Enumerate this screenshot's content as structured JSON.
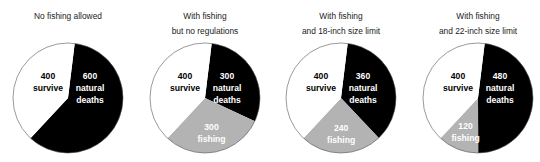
{
  "chart_data": [
    {
      "type": "pie",
      "title": "No fishing allowed",
      "title_lines": [
        "No fishing allowed"
      ],
      "slices": [
        {
          "name": "natural deaths",
          "value": 600,
          "color": "#000000",
          "label_lines": [
            "600",
            "natural",
            "deaths"
          ],
          "label_color": "#ffffff"
        },
        {
          "name": "fishing",
          "value": 0,
          "color": "#b3b3b3",
          "label_lines": [],
          "label_color": "#ffffff"
        },
        {
          "name": "survive",
          "value": 400,
          "color": "#ffffff",
          "label_lines": [
            "400",
            "survive"
          ],
          "label_color": "#000000"
        }
      ],
      "start_angle_deg": 7
    },
    {
      "type": "pie",
      "title": "With fishing but no regulations",
      "title_lines": [
        "With fishing",
        "but no regulations"
      ],
      "slices": [
        {
          "name": "natural deaths",
          "value": 300,
          "color": "#000000",
          "label_lines": [
            "300",
            "natural",
            "deaths"
          ],
          "label_color": "#ffffff"
        },
        {
          "name": "fishing",
          "value": 300,
          "color": "#b3b3b3",
          "label_lines": [
            "300",
            "fishing"
          ],
          "label_color": "#ffffff"
        },
        {
          "name": "survive",
          "value": 400,
          "color": "#ffffff",
          "label_lines": [
            "400",
            "survive"
          ],
          "label_color": "#000000"
        }
      ],
      "start_angle_deg": 7
    },
    {
      "type": "pie",
      "title": "With fishing and 18-inch size limit",
      "title_lines": [
        "With fishing",
        "and 18-inch size limit"
      ],
      "slices": [
        {
          "name": "natural deaths",
          "value": 360,
          "color": "#000000",
          "label_lines": [
            "360",
            "natural",
            "deaths"
          ],
          "label_color": "#ffffff"
        },
        {
          "name": "fishing",
          "value": 240,
          "color": "#b3b3b3",
          "label_lines": [
            "240",
            "fishing"
          ],
          "label_color": "#ffffff"
        },
        {
          "name": "survive",
          "value": 400,
          "color": "#ffffff",
          "label_lines": [
            "400",
            "survive"
          ],
          "label_color": "#000000"
        }
      ],
      "start_angle_deg": 7
    },
    {
      "type": "pie",
      "title": "With fishing and 22-inch size limit",
      "title_lines": [
        "With fishing",
        "and 22-inch size limit"
      ],
      "slices": [
        {
          "name": "natural deaths",
          "value": 480,
          "color": "#000000",
          "label_lines": [
            "480",
            "natural",
            "deaths"
          ],
          "label_color": "#ffffff"
        },
        {
          "name": "fishing",
          "value": 120,
          "color": "#b3b3b3",
          "label_lines": [
            "120",
            "fishing"
          ],
          "label_color": "#ffffff"
        },
        {
          "name": "survive",
          "value": 400,
          "color": "#ffffff",
          "label_lines": [
            "400",
            "survive"
          ],
          "label_color": "#000000"
        }
      ],
      "start_angle_deg": 7
    }
  ],
  "panels": [
    {
      "title_line1": "No fishing allowed",
      "title_line2": ""
    },
    {
      "title_line1": "With fishing",
      "title_line2": "but no regulations"
    },
    {
      "title_line1": "With fishing",
      "title_line2": "and 18-inch size limit"
    },
    {
      "title_line1": "With fishing",
      "title_line2": "and 22-inch size limit"
    }
  ],
  "layout": {
    "centers_x": [
      68,
      205,
      341,
      478
    ],
    "center_y": 98,
    "radius": 55
  }
}
